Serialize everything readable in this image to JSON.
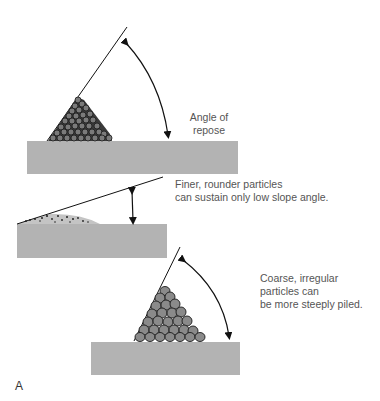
{
  "figure": {
    "panel_letter": "A",
    "colors": {
      "surface": "#b3b3b3",
      "particle_fill": "#8c8c8c",
      "particle_stroke": "#222222",
      "line": "#111111",
      "text": "#555555"
    },
    "diagrams": [
      {
        "id": "angle-of-repose",
        "label_lines": [
          "Angle of",
          "repose"
        ]
      },
      {
        "id": "fine-particles",
        "label_lines": [
          "Finer, rounder particles",
          "can sustain only low slope angle."
        ]
      },
      {
        "id": "coarse-particles",
        "label_lines": [
          "Coarse, irregular",
          "particles can",
          "be more steeply piled."
        ]
      }
    ]
  }
}
